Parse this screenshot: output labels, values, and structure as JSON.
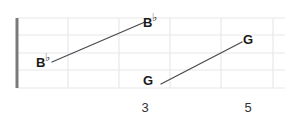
{
  "diagram": {
    "type": "guitar-fretboard",
    "title": "",
    "colors": {
      "background": "#ffffff",
      "grid_line": "#e8e8e8",
      "nut": "#7a7a7a",
      "connector": "#4a4a52",
      "label_text": "#1a1a1a",
      "fret_number_text": "#333333"
    },
    "board": {
      "nut": {
        "x": 17,
        "y_top": 18,
        "y_bottom": 88,
        "width": 3
      },
      "fret_lines_x": [
        68,
        119,
        170,
        221,
        273
      ],
      "string_lines_y": [
        18,
        35,
        53,
        70,
        88
      ],
      "left": 17,
      "right": 285,
      "top": 18,
      "bottom": 88
    },
    "notes": [
      {
        "id": "note-bflat-low",
        "label": "B",
        "accidental": "♭",
        "x": 36,
        "y": 53,
        "anchor_x": 52,
        "anchor_y": 62
      },
      {
        "id": "note-bflat-high",
        "label": "B",
        "accidental": "♭",
        "x": 143,
        "y": 13,
        "anchor_x": 145,
        "anchor_y": 22
      },
      {
        "id": "note-g-low",
        "label": "G",
        "accidental": "",
        "x": 143,
        "y": 74,
        "anchor_x": 161,
        "anchor_y": 84
      },
      {
        "id": "note-g-high",
        "label": "G",
        "accidental": "",
        "x": 243,
        "y": 33,
        "anchor_x": 242,
        "anchor_y": 42
      }
    ],
    "connectors": [
      {
        "id": "connector-bflat",
        "x1": 52,
        "y1": 62,
        "x2": 145,
        "y2": 22
      },
      {
        "id": "connector-g",
        "x1": 161,
        "y1": 84,
        "x2": 242,
        "y2": 42
      }
    ],
    "fret_numbers": [
      {
        "id": "fret-number-3",
        "label": "3",
        "x": 145,
        "y": 101
      },
      {
        "id": "fret-number-5",
        "label": "5",
        "x": 248,
        "y": 101
      }
    ]
  }
}
